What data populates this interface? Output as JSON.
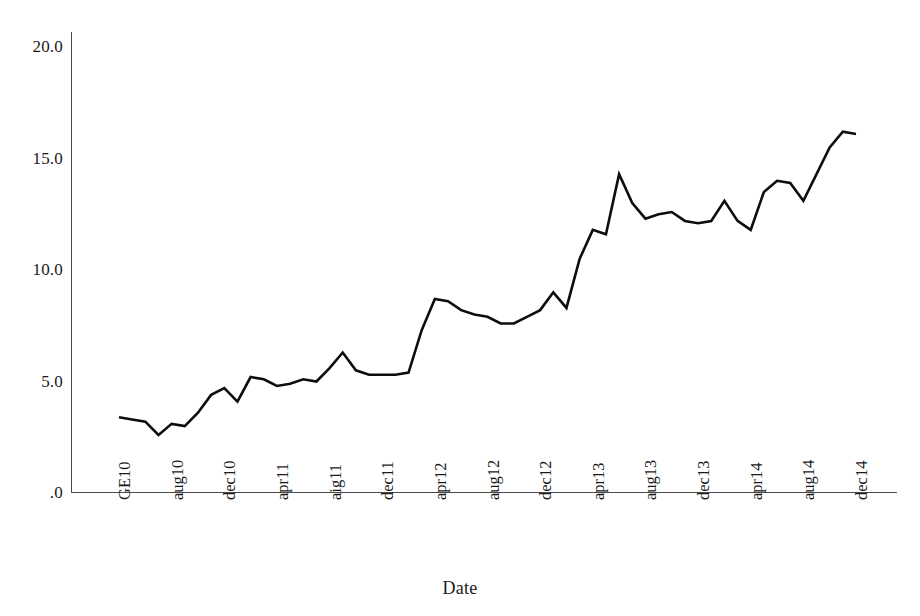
{
  "chart_data": {
    "type": "line",
    "title": "",
    "xlabel": "Date",
    "ylabel": "",
    "ylim": [
      0,
      20
    ],
    "yticks": [
      0,
      5,
      10,
      15,
      20
    ],
    "ytick_labels": [
      ".0",
      "5.0",
      "10.0",
      "15.0",
      "20.0"
    ],
    "grid": false,
    "legend": false,
    "xtick_labels": [
      "GE10",
      "aug10",
      "dec10",
      "apr11",
      "aig11",
      "dec11",
      "apr12",
      "aug12",
      "dec12",
      "apr13",
      "aug13",
      "dec13",
      "apr14",
      "aug14",
      "dec14"
    ],
    "xtick_every": 4,
    "x_index": [
      0,
      1,
      2,
      3,
      4,
      5,
      6,
      7,
      8,
      9,
      10,
      11,
      12,
      13,
      14,
      15,
      16,
      17,
      18,
      19,
      20,
      21,
      22,
      23,
      24,
      25,
      26,
      27,
      28,
      29,
      30,
      31,
      32,
      33,
      34,
      35,
      36,
      37,
      38,
      39,
      40,
      41,
      42,
      43,
      44,
      45,
      46,
      47,
      48,
      49,
      50,
      51,
      52,
      53,
      54,
      55,
      56
    ],
    "values": [
      3.4,
      3.3,
      3.2,
      2.6,
      3.1,
      3.0,
      3.6,
      4.4,
      4.7,
      4.1,
      5.2,
      5.1,
      4.8,
      4.9,
      5.1,
      5.0,
      5.6,
      6.3,
      5.5,
      5.3,
      5.3,
      5.3,
      5.4,
      7.3,
      8.7,
      8.6,
      8.2,
      8.0,
      7.9,
      7.6,
      7.6,
      7.9,
      8.2,
      9.0,
      8.3,
      10.5,
      11.8,
      11.6,
      14.3,
      13.0,
      12.3,
      12.5,
      12.6,
      12.2,
      12.1,
      12.2,
      13.1,
      12.2,
      11.8,
      13.5,
      14.0,
      13.9,
      13.1,
      14.3,
      15.5,
      16.2,
      16.1
    ],
    "series_color": "#0d0d0d",
    "axis_color": "#4a4a4a"
  },
  "axes": {
    "x_title": "Date"
  }
}
